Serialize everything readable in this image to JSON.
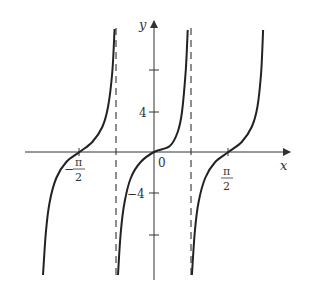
{
  "chart_data": {
    "type": "line",
    "title": "",
    "xlabel": "x",
    "ylabel": "y",
    "x_ticks": [
      {
        "value": -1.5708,
        "label_num": "π",
        "label_den": "2",
        "label_sign": "−"
      },
      {
        "value": 0,
        "label": "0"
      },
      {
        "value": 1.5708,
        "label_num": "π",
        "label_den": "2",
        "label_sign": ""
      }
    ],
    "y_ticks": [
      {
        "value": 8,
        "label": ""
      },
      {
        "value": 4,
        "label": "4"
      },
      {
        "value": -4,
        "label": "−4"
      },
      {
        "value": -8,
        "label": ""
      }
    ],
    "asymptotes": [
      -0.7854,
      0.7854
    ],
    "asymptote_style": "dashed",
    "xlim": [
      -2.5,
      2.8
    ],
    "ylim": [
      -12.5,
      13
    ],
    "grid": false,
    "legend": null,
    "series": [
      {
        "name": "branch-left",
        "points": [
          [
            -2.34,
            -12.3
          ],
          [
            -2.28,
            -8.0
          ],
          [
            -2.2,
            -5.0
          ],
          [
            -2.06,
            -2.6
          ],
          [
            -1.85,
            -1.0
          ],
          [
            -1.5708,
            0
          ],
          [
            -1.3,
            1.0
          ],
          [
            -1.09,
            2.5
          ],
          [
            -0.97,
            4.5
          ],
          [
            -0.88,
            8.0
          ],
          [
            -0.83,
            12.3
          ]
        ]
      },
      {
        "name": "branch-middle",
        "points": [
          [
            -0.76,
            -12.3
          ],
          [
            -0.7,
            -8.0
          ],
          [
            -0.62,
            -5.0
          ],
          [
            -0.49,
            -2.6
          ],
          [
            -0.28,
            -1.0
          ],
          [
            0,
            0
          ],
          [
            0.335,
            0.6
          ],
          [
            0.5,
            2.0
          ],
          [
            0.59,
            4.0
          ],
          [
            0.67,
            8.2
          ],
          [
            0.71,
            12.2
          ]
        ]
      },
      {
        "name": "branch-right",
        "points": [
          [
            0.8,
            -12.3
          ],
          [
            0.86,
            -8.0
          ],
          [
            0.94,
            -5.0
          ],
          [
            1.08,
            -2.6
          ],
          [
            1.29,
            -1.0
          ],
          [
            1.5708,
            0
          ],
          [
            1.85,
            1.0
          ],
          [
            2.06,
            2.5
          ],
          [
            2.18,
            4.5
          ],
          [
            2.26,
            8.0
          ],
          [
            2.3,
            12.2
          ]
        ]
      }
    ]
  },
  "labels": {
    "x_axis": "x",
    "y_axis": "y",
    "origin": "0",
    "y_tick_4": "4",
    "y_tick_neg4": "−4",
    "pi": "π",
    "two": "2",
    "minus": "−"
  }
}
